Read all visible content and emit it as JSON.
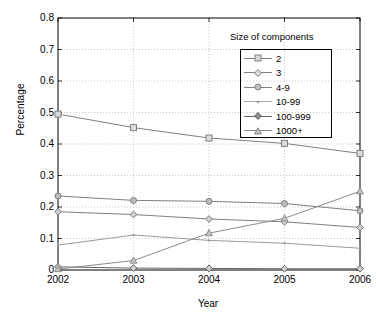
{
  "chart_data": {
    "type": "line",
    "title": "",
    "xlabel": "Year",
    "ylabel": "Percentage",
    "x": [
      2002,
      2003,
      2004,
      2005,
      2006
    ],
    "xtick_labels": [
      "2002",
      "2003",
      "2004",
      "2005",
      "2006"
    ],
    "ytick_labels": [
      "0",
      "0.1",
      "0.2",
      "0.3",
      "0.4",
      "0.5",
      "0.6",
      "0.7",
      "0.8"
    ],
    "ytick_values": [
      0,
      0.1,
      0.2,
      0.3,
      0.4,
      0.5,
      0.6,
      0.7,
      0.8
    ],
    "xlim": [
      2002,
      2006
    ],
    "ylim": [
      0,
      0.8
    ],
    "grid": true,
    "grid_style": "dotted",
    "legend_title": "Size of components",
    "legend_position": "top-right-inside",
    "series": [
      {
        "name": "2",
        "marker": "square",
        "color": "#808080",
        "values": [
          0.495,
          0.452,
          0.419,
          0.402,
          0.37
        ]
      },
      {
        "name": "3",
        "marker": "diamond",
        "color": "#808080",
        "values": [
          0.185,
          0.176,
          0.162,
          0.153,
          0.135
        ]
      },
      {
        "name": "4-9",
        "marker": "circle",
        "color": "#808080",
        "values": [
          0.235,
          0.221,
          0.218,
          0.211,
          0.188
        ]
      },
      {
        "name": "10-99",
        "marker": "dot",
        "color": "#999999",
        "values": [
          0.079,
          0.111,
          0.094,
          0.085,
          0.069
        ]
      },
      {
        "name": "100-999",
        "marker": "diamond",
        "color": "#666666",
        "values": [
          0.01,
          0.006,
          0.005,
          0.004,
          0.004
        ]
      },
      {
        "name": "1000+",
        "marker": "triangle",
        "color": "#8c8c8c",
        "values": [
          0.003,
          0.03,
          0.117,
          0.164,
          0.25
        ]
      }
    ],
    "legend_entries": [
      "2",
      "3",
      "4-9",
      "10-99",
      "100-999",
      "1000+"
    ],
    "colors": {
      "axis": "#000000",
      "grid": "#b0b0b0",
      "background": "#ffffff",
      "line": "#808080"
    }
  }
}
